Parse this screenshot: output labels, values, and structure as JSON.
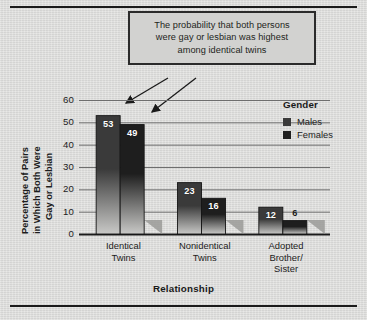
{
  "figure": {
    "callout": [
      "The probability that both persons",
      "were gay or lesbian was highest",
      "among identical twins"
    ],
    "callout_arrow_count": 2
  },
  "legend": {
    "title": "Gender",
    "items": [
      {
        "label": "Males",
        "color": "#3a3a3a"
      },
      {
        "label": "Females",
        "color": "#1e1e1e"
      }
    ]
  },
  "chart_data": {
    "type": "bar",
    "title": "",
    "xlabel": "Relationship",
    "ylabel": "Percentage of Pairs in Which Both Were Gay or Lesbian",
    "ylabel_lines": [
      "Percentage of Pairs",
      "in Which Both Were",
      "Gay or Lesbian"
    ],
    "categories": [
      "Identical Twins",
      "Nonidentical Twins",
      "Adopted Brother/ Sister"
    ],
    "category_lines": [
      [
        "Identical",
        "Twins"
      ],
      [
        "Nonidentical",
        "Twins"
      ],
      [
        "Adopted",
        "Brother/",
        "Sister"
      ]
    ],
    "series": [
      {
        "name": "Males",
        "values": [
          53,
          23,
          12
        ],
        "color": "#3a3a3a"
      },
      {
        "name": "Females",
        "values": [
          49,
          16,
          6
        ],
        "color": "#1e1e1e"
      }
    ],
    "ylim": [
      0,
      60
    ],
    "yticks": [
      0,
      10,
      20,
      30,
      40,
      50,
      60
    ],
    "ytick_labels": [
      "0",
      "10",
      "20",
      "30",
      "40",
      "50",
      "60"
    ],
    "grid": true,
    "grid_axis": "y",
    "legend_position": "right"
  }
}
